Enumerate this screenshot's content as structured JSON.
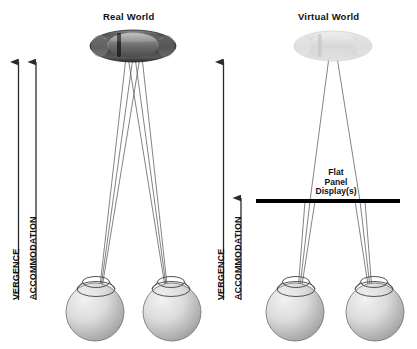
{
  "figure": {
    "type": "diagram",
    "background_color": "#ffffff"
  },
  "panels": {
    "left": {
      "title": "Real World",
      "object": {
        "name": "car",
        "style": "solid",
        "tone": "#4a4a4a",
        "note": "top-down view of a car, dark grey, fully opaque"
      },
      "axes": [
        {
          "label": "VERGENCE",
          "arrow": "up",
          "tip_y": 62,
          "base_y": 300
        },
        {
          "label": "ACCOMMODATION",
          "arrow": "up",
          "tip_y": 62,
          "base_y": 300
        }
      ],
      "eyes": [
        {
          "name": "left-eye",
          "cx": 95,
          "cy": 312
        },
        {
          "name": "right-eye",
          "cx": 172,
          "cy": 312
        }
      ],
      "rays": {
        "converge_at": "car",
        "count_per_eye": 3,
        "color": "#555555"
      }
    },
    "right": {
      "title": "Virtual World",
      "object": {
        "name": "car",
        "style": "ghosted",
        "tone": "#d8d8d8",
        "note": "same car rendered faint / translucent to indicate a virtual object"
      },
      "display": {
        "label_lines": [
          "Flat",
          "Panel",
          "Display(s)"
        ],
        "label": "Flat Panel Display(s)",
        "y": 201,
        "x_start": 256,
        "x_end": 400,
        "color": "#000000",
        "thickness": 4
      },
      "axes": [
        {
          "label": "VERGENCE",
          "arrow": "up",
          "tip_y": 62,
          "base_y": 300
        },
        {
          "label": "ACCOMMODATION",
          "arrow": "up",
          "tip_y": 198,
          "base_y": 300
        }
      ],
      "eyes": [
        {
          "name": "left-eye",
          "cx": 295,
          "cy": 312
        },
        {
          "name": "right-eye",
          "cx": 375,
          "cy": 312
        }
      ],
      "rays": {
        "converge_at": "car",
        "refract_at": "display",
        "count_per_eye": 3,
        "color": "#555555"
      }
    }
  },
  "colors": {
    "ink": "#111111",
    "ray": "#555555",
    "eye_fill_light": "#e9e9e9",
    "eye_fill_dark": "#9a9a9a",
    "eye_stroke": "#6e6e6e",
    "panel": "#000000",
    "arrow": "#333333"
  }
}
